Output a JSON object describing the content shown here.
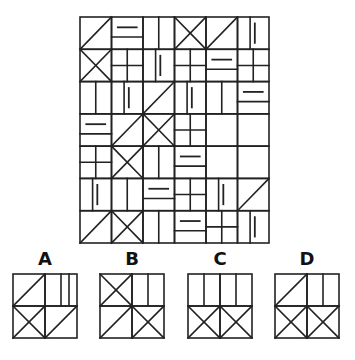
{
  "puzzle": {
    "grid": {
      "x": 80,
      "y": 17,
      "width": 189,
      "height": 226,
      "cols": 6,
      "rows": 7,
      "stroke_color": "#222222",
      "cells": [
        [
          "diag",
          "hsplit_seg",
          "vsplit",
          "x",
          "diag",
          "vsplit_seg"
        ],
        [
          "x",
          "quad",
          "vsplit_seg",
          "quad",
          "hsplit_seg",
          "quad"
        ],
        [
          "vsplit",
          "vsplit_seg",
          "diag",
          "vsplit_seg",
          "vsplit",
          "hsplit_seg"
        ],
        [
          "hsplit_seg",
          "diag",
          "x",
          "quad",
          "empty",
          "empty"
        ],
        [
          "quad",
          "x",
          "vsplit",
          "hsplit_seg",
          "empty",
          "empty"
        ],
        [
          "vsplit_seg",
          "vsplit",
          "hsplit_seg",
          "quad",
          "vsplit_seg",
          "diag"
        ],
        [
          "diag",
          "x",
          "vsplit",
          "hsplit_seg",
          "quad",
          "vsplit_seg"
        ]
      ]
    },
    "options": [
      {
        "label": "A",
        "x": 13,
        "y": 274,
        "size": 64,
        "cells": [
          [
            "diag",
            "vsplit_seg_plain"
          ],
          [
            "x",
            "diag"
          ]
        ]
      },
      {
        "label": "B",
        "x": 100,
        "y": 274,
        "size": 64,
        "cells": [
          [
            "x",
            "vsplit"
          ],
          [
            "diag",
            "x"
          ]
        ]
      },
      {
        "label": "C",
        "x": 188,
        "y": 274,
        "size": 64,
        "cells": [
          [
            "vsplit",
            "vsplit"
          ],
          [
            "x",
            "x"
          ]
        ]
      },
      {
        "label": "D",
        "x": 275,
        "y": 274,
        "size": 64,
        "cells": [
          [
            "diag",
            "vsplit"
          ],
          [
            "x",
            "x"
          ]
        ]
      }
    ]
  }
}
